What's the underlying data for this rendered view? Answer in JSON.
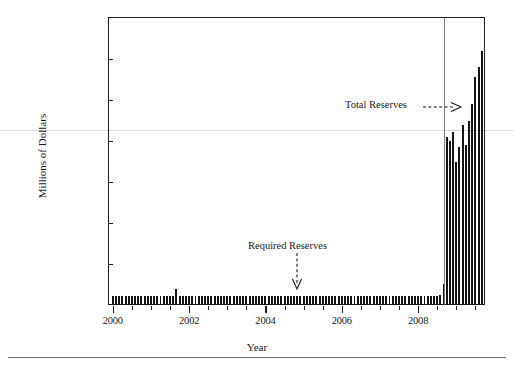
{
  "chart_data": {
    "type": "bar",
    "title": "",
    "subtitle": "",
    "xlabel": "Year",
    "ylabel": "Millions of Dollars",
    "xlim": [
      1999.9,
      2009.7
    ],
    "ylim": [
      0,
      1400000
    ],
    "grid": false,
    "legend_position": "none",
    "ytick_labels": [
      "0",
      "200000",
      "400000",
      "600000",
      "800000",
      "1000000",
      "1200000",
      "1400000"
    ],
    "ytick_values": [
      0,
      200000,
      400000,
      600000,
      800000,
      1000000,
      1200000,
      1400000
    ],
    "xtick_labels": [
      "2000",
      "2002",
      "2004",
      "2006",
      "2008"
    ],
    "xtick_values": [
      2000,
      2002,
      2004,
      2006,
      2008
    ],
    "xtick_minor_values": [
      2000.5,
      2001,
      2001.5,
      2002.5,
      2003,
      2003.5,
      2004.5,
      2005,
      2005.5,
      2006.5,
      2007,
      2007.5,
      2008.5,
      2009,
      2009.5
    ],
    "annotations": [
      {
        "name": "total-reserves",
        "text": "Total Reserves",
        "arrow": "right",
        "x": 2008.05,
        "y": 920000
      },
      {
        "name": "required-reserves",
        "text": "Required Reserves",
        "arrow": "down",
        "x": 2004.8,
        "y": 260000
      }
    ],
    "event_line": {
      "name": "crisis-line",
      "x": 2008.67,
      "label": ""
    },
    "series": [
      {
        "name": "Total Reserves",
        "x": [
          2000.0,
          2000.083,
          2000.167,
          2000.25,
          2000.333,
          2000.417,
          2000.5,
          2000.583,
          2000.667,
          2000.75,
          2000.833,
          2000.917,
          2001.0,
          2001.083,
          2001.167,
          2001.25,
          2001.333,
          2001.417,
          2001.5,
          2001.583,
          2001.667,
          2001.75,
          2001.833,
          2001.917,
          2002.0,
          2002.083,
          2002.167,
          2002.25,
          2002.333,
          2002.417,
          2002.5,
          2002.583,
          2002.667,
          2002.75,
          2002.833,
          2002.917,
          2003.0,
          2003.083,
          2003.167,
          2003.25,
          2003.333,
          2003.417,
          2003.5,
          2003.583,
          2003.667,
          2003.75,
          2003.833,
          2003.917,
          2004.0,
          2004.083,
          2004.167,
          2004.25,
          2004.333,
          2004.417,
          2004.5,
          2004.583,
          2004.667,
          2004.75,
          2004.833,
          2004.917,
          2005.0,
          2005.083,
          2005.167,
          2005.25,
          2005.333,
          2005.417,
          2005.5,
          2005.583,
          2005.667,
          2005.75,
          2005.833,
          2005.917,
          2006.0,
          2006.083,
          2006.167,
          2006.25,
          2006.333,
          2006.417,
          2006.5,
          2006.583,
          2006.667,
          2006.75,
          2006.833,
          2006.917,
          2007.0,
          2007.083,
          2007.167,
          2007.25,
          2007.333,
          2007.417,
          2007.5,
          2007.583,
          2007.667,
          2007.75,
          2007.833,
          2007.917,
          2008.0,
          2008.083,
          2008.167,
          2008.25,
          2008.333,
          2008.417,
          2008.5,
          2008.583,
          2008.667,
          2008.75,
          2008.833,
          2008.917,
          2009.0,
          2009.083,
          2009.167,
          2009.25,
          2009.333,
          2009.417,
          2009.5,
          2009.583,
          2009.667
        ],
        "values": [
          45000,
          44000,
          44500,
          43500,
          43000,
          42500,
          43000,
          42500,
          42000,
          42500,
          42000,
          44000,
          43000,
          42500,
          43000,
          44000,
          44500,
          44000,
          45000,
          44500,
          78000,
          46000,
          45000,
          46000,
          45000,
          44500,
          44000,
          44500,
          44000,
          43500,
          43000,
          43500,
          43000,
          43500,
          43000,
          45000,
          44000,
          43500,
          44000,
          44500,
          44000,
          43500,
          44000,
          43500,
          43000,
          43500,
          43000,
          44500,
          44000,
          43500,
          44000,
          44500,
          45000,
          44500,
          44000,
          44500,
          44000,
          44500,
          44000,
          45500,
          45000,
          44500,
          44000,
          44500,
          44000,
          43500,
          43000,
          43500,
          43000,
          43500,
          43000,
          45000,
          44000,
          43500,
          43000,
          43500,
          43000,
          42500,
          42000,
          42500,
          42000,
          42500,
          42000,
          44000,
          43000,
          42500,
          43000,
          43500,
          43000,
          42500,
          43000,
          42500,
          43000,
          43500,
          43000,
          44500,
          44000,
          44500,
          45000,
          45500,
          45000,
          45500,
          46000,
          47000,
          103000,
          820000,
          800000,
          845000,
          700000,
          770000,
          880000,
          780000,
          900000,
          980000,
          1110000,
          1160000,
          1240000
        ]
      },
      {
        "name": "Required Reserves",
        "x": [
          2000.0,
          2001.0,
          2002.0,
          2003.0,
          2004.0,
          2005.0,
          2006.0,
          2007.0,
          2008.0,
          2009.0
        ],
        "values": [
          41000,
          40000,
          40500,
          41000,
          41500,
          41000,
          40000,
          39500,
          41000,
          60000
        ]
      }
    ]
  }
}
